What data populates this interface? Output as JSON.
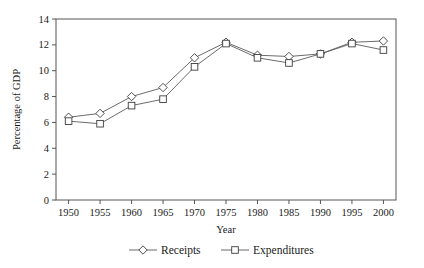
{
  "chart_data": {
    "type": "line",
    "title": "",
    "xlabel": "Year",
    "ylabel": "Percentage of GDP",
    "x": [
      1950,
      1955,
      1960,
      1965,
      1970,
      1975,
      1980,
      1985,
      1990,
      1995,
      2000
    ],
    "xtick_labels": [
      "1950",
      "1955",
      "1960",
      "1965",
      "1970",
      "1975",
      "1980",
      "1985",
      "1990",
      "1995",
      "2000"
    ],
    "ytick_labels": [
      "0",
      "2",
      "4",
      "6",
      "8",
      "10",
      "12",
      "14"
    ],
    "yticks": [
      0,
      2,
      4,
      6,
      8,
      10,
      12,
      14
    ],
    "xlim": [
      1948,
      2002
    ],
    "ylim": [
      0,
      14
    ],
    "grid": false,
    "legend_position": "below",
    "series": [
      {
        "name": "Receipts",
        "marker": "diamond",
        "values": [
          6.4,
          6.7,
          8.0,
          8.7,
          11.0,
          12.2,
          11.2,
          11.1,
          11.3,
          12.2,
          12.3
        ]
      },
      {
        "name": "Expenditures",
        "marker": "square",
        "values": [
          6.1,
          5.9,
          7.3,
          7.8,
          10.3,
          12.1,
          11.0,
          10.6,
          11.3,
          12.1,
          11.6
        ]
      }
    ],
    "colors": {
      "line": "#5a5a5a",
      "marker_fill": "#ffffff",
      "marker_stroke": "#3d3d3d",
      "axis": "#555555",
      "text": "#1a1a1a",
      "background": "#ffffff"
    }
  },
  "legend": {
    "items": [
      {
        "label": "Receipts",
        "marker": "diamond"
      },
      {
        "label": "Expenditures",
        "marker": "square"
      }
    ]
  }
}
